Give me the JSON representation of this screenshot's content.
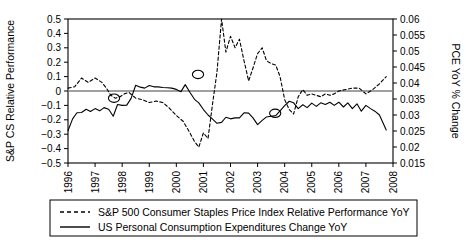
{
  "chart_data": {
    "type": "line",
    "title": "",
    "xlabel": "",
    "ylabel": "S&P CS Relative Performance",
    "y2label": "PCE YoY % Change",
    "grid": false,
    "legend_position": "below",
    "xlim": [
      1996,
      2008
    ],
    "ylim": [
      -0.5,
      0.5
    ],
    "y2lim": [
      0.015,
      0.06
    ],
    "xticks": [
      "1996",
      "1997",
      "1998",
      "1999",
      "2000",
      "2001",
      "2002",
      "2003",
      "2004",
      "2005",
      "2006",
      "2007",
      "2008"
    ],
    "yticks": [
      "0.5",
      "0.4",
      "0.3",
      "0.2",
      "0.1",
      "0",
      "-0.1",
      "-0.2",
      "-0.3",
      "-0.4",
      "-0.5"
    ],
    "y2ticks": [
      "0.06",
      "0.055",
      "0.05",
      "0.045",
      "0.04",
      "0.035",
      "0.03",
      "0.025",
      "0.02",
      "0.015"
    ],
    "zero_line": 0,
    "annotations": [
      {
        "name": "crossover-marker",
        "x": 1997.7,
        "y": -0.05
      },
      {
        "name": "crossover-marker",
        "x": 2000.8,
        "y": 0.115
      },
      {
        "name": "crossover-marker",
        "x": 2003.65,
        "y": -0.155
      }
    ],
    "series": [
      {
        "name": "S&P 500 Consumer Staples Price Index Relative Performance YoY",
        "axis": "left",
        "style": "dashed",
        "color": "#000000",
        "x": [
          1996.0,
          1996.25,
          1996.5,
          1996.75,
          1997.0,
          1997.25,
          1997.42,
          1997.58,
          1997.75,
          1997.92,
          1998.08,
          1998.25,
          1998.5,
          1998.75,
          1999.0,
          1999.25,
          1999.5,
          1999.75,
          2000.0,
          2000.25,
          2000.5,
          2000.67,
          2000.83,
          2001.0,
          2001.17,
          2001.33,
          2001.5,
          2001.67,
          2001.83,
          2002.0,
          2002.17,
          2002.33,
          2002.5,
          2002.67,
          2002.83,
          2003.0,
          2003.17,
          2003.33,
          2003.5,
          2003.67,
          2003.83,
          2004.0,
          2004.17,
          2004.33,
          2004.5,
          2004.67,
          2004.83,
          2005.0,
          2005.17,
          2005.33,
          2005.5,
          2005.67,
          2005.83,
          2006.0,
          2006.25,
          2006.5,
          2006.75,
          2007.0,
          2007.25,
          2007.5,
          2007.75
        ],
        "y": [
          0.02,
          0.03,
          0.09,
          0.06,
          0.09,
          0.06,
          0.02,
          -0.03,
          -0.05,
          -0.04,
          -0.02,
          -0.01,
          -0.05,
          -0.06,
          -0.08,
          -0.07,
          -0.08,
          -0.12,
          -0.17,
          -0.21,
          -0.29,
          -0.35,
          -0.39,
          -0.29,
          -0.33,
          -0.1,
          0.13,
          0.5,
          0.27,
          0.38,
          0.3,
          0.36,
          0.21,
          0.07,
          0.16,
          0.26,
          0.3,
          0.21,
          0.19,
          0.18,
          0.1,
          -0.06,
          -0.13,
          -0.16,
          -0.04,
          0.01,
          -0.03,
          -0.02,
          -0.03,
          -0.04,
          -0.02,
          -0.03,
          -0.02,
          0.0,
          0.01,
          0.02,
          0.02,
          -0.02,
          0.01,
          0.05,
          0.1
        ]
      },
      {
        "name": "US Personal Consumption Expenditures Change YoY",
        "axis": "right",
        "style": "solid",
        "color": "#000000",
        "x": [
          1996.0,
          1996.17,
          1996.33,
          1996.5,
          1996.67,
          1996.83,
          1997.0,
          1997.17,
          1997.33,
          1997.5,
          1997.67,
          1997.83,
          1998.0,
          1998.17,
          1998.33,
          1998.5,
          1998.67,
          1998.83,
          1999.0,
          1999.17,
          1999.33,
          1999.5,
          1999.67,
          1999.83,
          2000.0,
          2000.17,
          2000.33,
          2000.5,
          2000.67,
          2000.83,
          2001.0,
          2001.17,
          2001.33,
          2001.5,
          2001.67,
          2001.83,
          2002.0,
          2002.17,
          2002.33,
          2002.5,
          2002.67,
          2002.83,
          2003.0,
          2003.17,
          2003.33,
          2003.5,
          2003.67,
          2003.83,
          2004.0,
          2004.17,
          2004.33,
          2004.5,
          2004.67,
          2004.83,
          2005.0,
          2005.17,
          2005.33,
          2005.5,
          2005.67,
          2005.83,
          2006.0,
          2006.17,
          2006.33,
          2006.5,
          2006.67,
          2006.83,
          2007.0,
          2007.17,
          2007.33,
          2007.5,
          2007.75
        ],
        "y2": [
          0.0251,
          0.0288,
          0.0307,
          0.0308,
          0.0318,
          0.0311,
          0.032,
          0.0313,
          0.0323,
          0.0318,
          0.0296,
          0.0333,
          0.033,
          0.0331,
          0.0352,
          0.0393,
          0.0387,
          0.0384,
          0.0392,
          0.0388,
          0.0388,
          0.0386,
          0.0385,
          0.0384,
          0.038,
          0.0373,
          0.0395,
          0.0371,
          0.0349,
          0.0338,
          0.0317,
          0.03,
          0.0288,
          0.0274,
          0.0277,
          0.0293,
          0.0288,
          0.0291,
          0.0291,
          0.0307,
          0.0306,
          0.0291,
          0.027,
          0.0283,
          0.0294,
          0.0296,
          0.0298,
          0.0313,
          0.0329,
          0.0343,
          0.0338,
          0.032,
          0.0332,
          0.0323,
          0.0337,
          0.0327,
          0.0338,
          0.0333,
          0.034,
          0.033,
          0.034,
          0.0325,
          0.0338,
          0.032,
          0.0335,
          0.0312,
          0.033,
          0.032,
          0.0312,
          0.03,
          0.0253
        ]
      }
    ]
  },
  "legend": {
    "items": [
      {
        "label": "S&P 500 Consumer Staples Price Index Relative Performance YoY",
        "style": "dashed"
      },
      {
        "label": "US Personal Consumption Expenditures Change YoY",
        "style": "solid"
      }
    ]
  }
}
